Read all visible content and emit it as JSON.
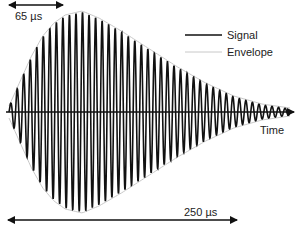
{
  "chart_data": {
    "type": "line",
    "title": "",
    "xlabel": "Time",
    "ylabel": "",
    "grid": false,
    "legend_position": "upper-right",
    "legend": [
      {
        "name": "Signal",
        "style": "solid",
        "color": "#111111"
      },
      {
        "name": "Envelope",
        "style": "solid",
        "color": "#cccccc"
      }
    ],
    "annotations": [
      {
        "text": "65 µs",
        "type": "double-arrow",
        "meaning": "rise time to envelope peak"
      },
      {
        "text": "250 µs",
        "type": "double-arrow",
        "meaning": "total burst duration"
      }
    ],
    "series": [
      {
        "name": "Signal",
        "description": "Sinusoidal burst, ~43 cycles, amplitude follows envelope",
        "cycles": 43
      },
      {
        "name": "Envelope",
        "description": "Rises to max at ~65 µs, then decays toward 0 by ~250 µs",
        "x_us": [
          0,
          10,
          20,
          30,
          40,
          50,
          65,
          80,
          100,
          125,
          150,
          175,
          200,
          225,
          250
        ],
        "y_norm": [
          0.05,
          0.3,
          0.55,
          0.75,
          0.88,
          0.96,
          1.0,
          0.93,
          0.8,
          0.62,
          0.44,
          0.28,
          0.15,
          0.07,
          0.03
        ]
      }
    ],
    "xlim_us": [
      0,
      250
    ],
    "ylim": [
      -1,
      1
    ]
  },
  "labels": {
    "rise_time": "65 µs",
    "duration": "250 µs",
    "x_axis": "Time",
    "legend_signal": "Signal",
    "legend_envelope": "Envelope"
  },
  "colors": {
    "signal": "#111111",
    "envelope": "#c8c8c8",
    "axis": "#111111"
  }
}
